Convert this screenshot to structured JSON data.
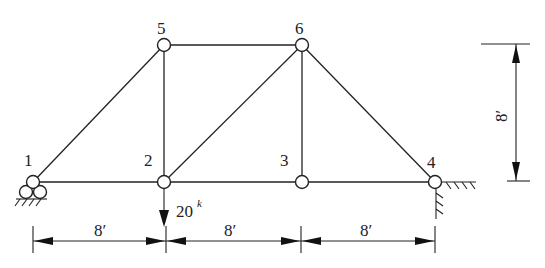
{
  "diagram": {
    "type": "plane truss",
    "joints": [
      {
        "id": "1",
        "label": "1",
        "x": 33,
        "y": 182
      },
      {
        "id": "2",
        "label": "2",
        "x": 164,
        "y": 182
      },
      {
        "id": "3",
        "label": "3",
        "x": 302,
        "y": 182
      },
      {
        "id": "4",
        "label": "4",
        "x": 435,
        "y": 182
      },
      {
        "id": "5",
        "label": "5",
        "x": 164,
        "y": 45
      },
      {
        "id": "6",
        "label": "6",
        "x": 302,
        "y": 45
      }
    ],
    "members": [
      [
        "1",
        "2"
      ],
      [
        "2",
        "3"
      ],
      [
        "3",
        "4"
      ],
      [
        "5",
        "6"
      ],
      [
        "1",
        "5"
      ],
      [
        "2",
        "5"
      ],
      [
        "2",
        "6"
      ],
      [
        "3",
        "6"
      ],
      [
        "4",
        "6"
      ]
    ],
    "supports": [
      {
        "joint": "1",
        "type": "roller"
      },
      {
        "joint": "4",
        "type": "pin (wall corner)"
      }
    ],
    "loads": [
      {
        "joint": "2",
        "direction": "down",
        "magnitude_label": "20",
        "unit_label": "k"
      }
    ],
    "dimensions": {
      "horizontal": [
        {
          "label": "8′",
          "from": "1",
          "to": "2"
        },
        {
          "label": "8′",
          "from": "2",
          "to": "3"
        },
        {
          "label": "8′",
          "from": "3",
          "to": "4"
        }
      ],
      "vertical": {
        "label": "8′"
      }
    }
  }
}
